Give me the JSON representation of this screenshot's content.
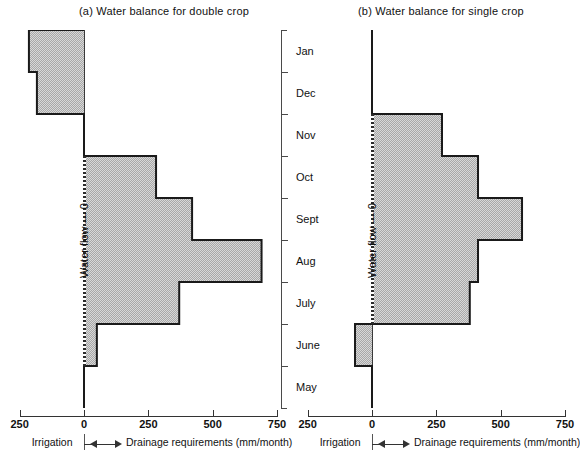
{
  "figure": {
    "panels": [
      {
        "id": "a",
        "title": "(a)  Water balance for double crop"
      },
      {
        "id": "b",
        "title": "(b)  Water balance for single crop"
      }
    ],
    "vertical_axis_label": "Water flow — 0",
    "month_labels": [
      "Jan",
      "Dec",
      "Nov",
      "Oct",
      "Sept",
      "Aug",
      "July",
      "June",
      "May"
    ],
    "scale_ticks": [
      "250",
      "0",
      "250",
      "500",
      "750"
    ],
    "left_caption": "Irrigation",
    "right_caption": "Drainage requirements (mm/month)",
    "colors": {
      "fill": "#a8a8a8",
      "outline": "#1a1a1a",
      "axis": "#3a3a3a",
      "text": "#111111",
      "background": "#ffffff"
    }
  },
  "chart_data": [
    {
      "type": "bar",
      "orientation": "horizontal",
      "title": "(a)  Water balance for double crop",
      "xlabel": "Drainage requirements (mm/month)",
      "ylabel": "",
      "xlim": [
        -250,
        750
      ],
      "xticks": [
        -250,
        0,
        250,
        500,
        750
      ],
      "xticklabels": [
        "250",
        "0",
        "250",
        "500",
        "750"
      ],
      "categories": [
        "Jan",
        "Dec",
        "Nov",
        "Oct",
        "Sept",
        "Aug",
        "July",
        "June",
        "May"
      ],
      "values": [
        -214,
        -183,
        0,
        280,
        420,
        690,
        370,
        50,
        0
      ],
      "units": "mm/month",
      "negative_meaning": "Irrigation",
      "positive_meaning": "Drainage requirements",
      "grid": false,
      "legend": "none"
    },
    {
      "type": "bar",
      "orientation": "horizontal",
      "title": "(b)  Water balance for single crop",
      "xlabel": "Drainage requirements (mm/month)",
      "ylabel": "",
      "xlim": [
        -250,
        750
      ],
      "xticks": [
        -250,
        0,
        250,
        500,
        750
      ],
      "xticklabels": [
        "250",
        "0",
        "250",
        "500",
        "750"
      ],
      "categories": [
        "Jan",
        "Dec",
        "Nov",
        "Oct",
        "Sept",
        "Aug",
        "July",
        "June",
        "May"
      ],
      "values": [
        0,
        0,
        272,
        412,
        583,
        412,
        380,
        -66,
        0
      ],
      "units": "mm/month",
      "negative_meaning": "Irrigation",
      "positive_meaning": "Drainage requirements",
      "grid": false,
      "legend": "none"
    }
  ]
}
